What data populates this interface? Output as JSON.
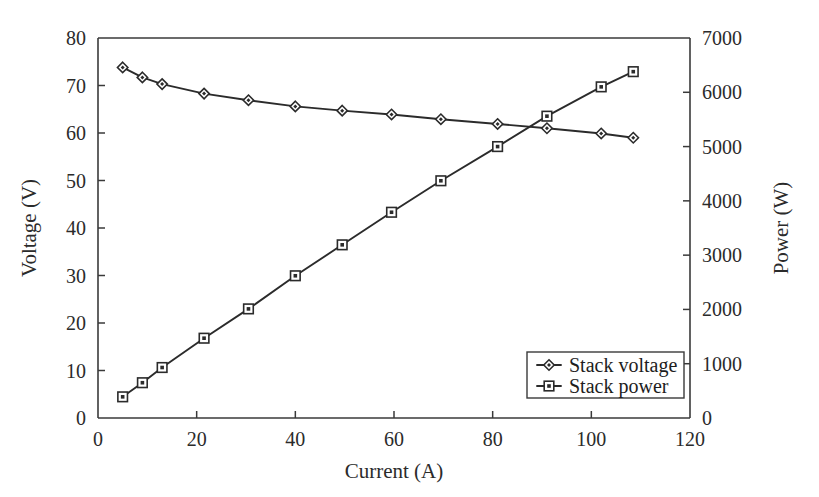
{
  "chart_data": {
    "type": "line",
    "title": "",
    "xlabel": "Current (A)",
    "ylabel": "Voltage (V)",
    "y2label": "Power (W)",
    "xlim": [
      0,
      120
    ],
    "ylim": [
      0,
      80
    ],
    "y2lim": [
      0,
      7000
    ],
    "xticks": [
      0,
      20,
      40,
      60,
      80,
      100,
      120
    ],
    "yticks": [
      0,
      10,
      20,
      30,
      40,
      50,
      60,
      70,
      80
    ],
    "y2ticks": [
      0,
      1000,
      2000,
      3000,
      4000,
      5000,
      6000,
      7000
    ],
    "xtick_labels": [
      "0",
      "20",
      "40",
      "60",
      "80",
      "100",
      "120"
    ],
    "ytick_labels": [
      "0",
      "10",
      "20",
      "30",
      "40",
      "50",
      "60",
      "70",
      "80"
    ],
    "y2tick_labels": [
      "0",
      "1000",
      "2000",
      "3000",
      "4000",
      "5000",
      "6000",
      "7000"
    ],
    "grid": false,
    "legend_position": "lower right",
    "series": [
      {
        "name": "Stack voltage",
        "axis": "left",
        "marker": "diamond",
        "x": [
          5,
          9,
          13,
          21.5,
          30.5,
          40,
          49.5,
          59.5,
          69.5,
          81,
          91,
          102,
          108.5
        ],
        "values": [
          73.8,
          71.7,
          70.3,
          68.3,
          66.9,
          65.6,
          64.7,
          63.9,
          62.9,
          61.9,
          61.0,
          59.9,
          59.0
        ]
      },
      {
        "name": "Stack power",
        "axis": "right",
        "marker": "square",
        "x": [
          5,
          9,
          13,
          21.5,
          30.5,
          40,
          49.5,
          59.5,
          69.5,
          81,
          91,
          102,
          108.5
        ],
        "values": [
          390,
          650,
          930,
          1470,
          2010,
          2620,
          3190,
          3790,
          4370,
          5000,
          5560,
          6100,
          6380
        ]
      }
    ]
  },
  "legend": {
    "entries": [
      {
        "label": "Stack voltage",
        "marker": "diamond"
      },
      {
        "label": "Stack power",
        "marker": "square"
      }
    ]
  }
}
